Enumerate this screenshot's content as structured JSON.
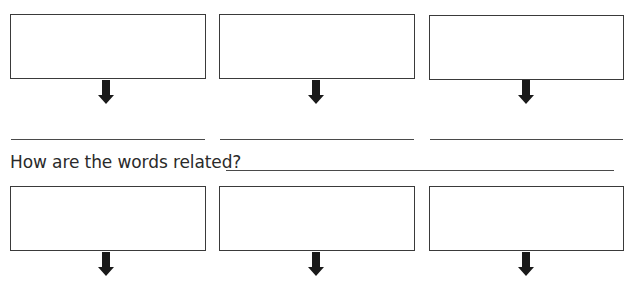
{
  "worksheet": {
    "question_label": "How are the words related?",
    "top_boxes": [
      {
        "value": ""
      },
      {
        "value": ""
      },
      {
        "value": ""
      }
    ],
    "word_lines": [
      {
        "value": ""
      },
      {
        "value": ""
      },
      {
        "value": ""
      }
    ],
    "relation_answer": "",
    "bottom_boxes": [
      {
        "value": ""
      },
      {
        "value": ""
      },
      {
        "value": ""
      }
    ],
    "colors": {
      "stroke": "#3a3a3a",
      "arrow": "#1a1a1a",
      "text": "#2a2a2a"
    }
  }
}
